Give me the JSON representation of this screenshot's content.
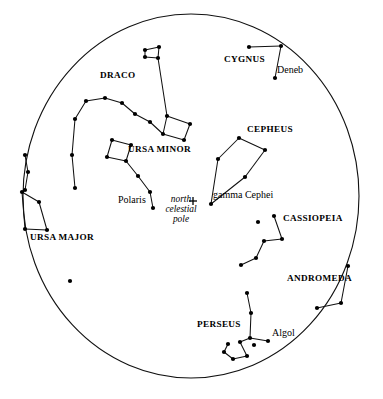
{
  "chart": {
    "type": "star-chart",
    "background_color": "#ffffff",
    "ink_color": "#111111",
    "horizon": {
      "center_x": 191,
      "center_y": 196,
      "radius_x": 168,
      "radius_y": 182
    },
    "pole_marker": {
      "symbol": "+",
      "x": 193,
      "y": 201
    }
  },
  "labels": {
    "constellations": [
      {
        "text": "DRACO",
        "x": 100,
        "y": 76
      },
      {
        "text": "CYGNUS",
        "x": 224,
        "y": 60
      },
      {
        "text": "CEPHEUS",
        "x": 247,
        "y": 130
      },
      {
        "text": "URSA MINOR",
        "x": 128,
        "y": 150
      },
      {
        "text": "CASSIOPEIA",
        "x": 283,
        "y": 219
      },
      {
        "text": "URSA MAJOR",
        "x": 30,
        "y": 238
      },
      {
        "text": "ANDROMEDA",
        "x": 287,
        "y": 279
      },
      {
        "text": "PERSEUS",
        "x": 197,
        "y": 325
      }
    ],
    "stars": [
      {
        "text": "Deneb",
        "x": 276,
        "y": 71
      },
      {
        "text": "Polaris",
        "x": 119,
        "y": 201
      },
      {
        "text": "gamma Cephei",
        "x": 212,
        "y": 196
      },
      {
        "text": "Algol",
        "x": 272,
        "y": 334
      }
    ],
    "pole": {
      "line1": "north",
      "line2": "celestial",
      "line3": "pole",
      "x": 160,
      "y": 196
    }
  },
  "chart_data": {
    "type": "scatter",
    "projection": "polar / circumpolar",
    "grid": false,
    "legend": false,
    "constellations": [
      {
        "name": "DRACO",
        "stars": [
          [
            159,
            47
          ],
          [
            145,
            50
          ],
          [
            145,
            57
          ],
          [
            158,
            58
          ],
          [
            167,
            116
          ],
          [
            190,
            124
          ],
          [
            184,
            140
          ],
          [
            163,
            134
          ],
          [
            150,
            122
          ],
          [
            135,
            114
          ],
          [
            122,
            103
          ],
          [
            105,
            98
          ],
          [
            86,
            101
          ],
          [
            75,
            119
          ],
          [
            72,
            155
          ],
          [
            75,
            188
          ]
        ],
        "segments": [
          [
            [
              159,
              47
            ],
            [
              145,
              50
            ]
          ],
          [
            [
              145,
              50
            ],
            [
              145,
              57
            ]
          ],
          [
            [
              145,
              57
            ],
            [
              158,
              58
            ]
          ],
          [
            [
              158,
              58
            ],
            [
              159,
              47
            ]
          ],
          [
            [
              158,
              58
            ],
            [
              167,
              116
            ]
          ],
          [
            [
              167,
              116
            ],
            [
              190,
              124
            ]
          ],
          [
            [
              190,
              124
            ],
            [
              184,
              140
            ]
          ],
          [
            [
              184,
              140
            ],
            [
              163,
              134
            ]
          ],
          [
            [
              163,
              134
            ],
            [
              167,
              116
            ]
          ],
          [
            [
              163,
              134
            ],
            [
              150,
              122
            ]
          ],
          [
            [
              150,
              122
            ],
            [
              135,
              114
            ]
          ],
          [
            [
              135,
              114
            ],
            [
              122,
              103
            ]
          ],
          [
            [
              122,
              103
            ],
            [
              105,
              98
            ]
          ],
          [
            [
              105,
              98
            ],
            [
              86,
              101
            ]
          ],
          [
            [
              86,
              101
            ],
            [
              75,
              119
            ]
          ],
          [
            [
              75,
              119
            ],
            [
              72,
              155
            ]
          ],
          [
            [
              72,
              155
            ],
            [
              75,
              188
            ]
          ]
        ]
      },
      {
        "name": "URSA MINOR",
        "stars": [
          [
            112,
            140
          ],
          [
            131,
            145
          ],
          [
            126,
            161
          ],
          [
            107,
            157
          ],
          [
            138,
            176
          ],
          [
            150,
            192
          ],
          [
            153,
            208
          ]
        ],
        "segments": [
          [
            [
              112,
              140
            ],
            [
              131,
              145
            ]
          ],
          [
            [
              131,
              145
            ],
            [
              126,
              161
            ]
          ],
          [
            [
              126,
              161
            ],
            [
              107,
              157
            ]
          ],
          [
            [
              107,
              157
            ],
            [
              112,
              140
            ]
          ],
          [
            [
              126,
              161
            ],
            [
              138,
              176
            ]
          ],
          [
            [
              138,
              176
            ],
            [
              150,
              192
            ]
          ],
          [
            [
              150,
              192
            ],
            [
              153,
              208
            ]
          ]
        ]
      },
      {
        "name": "URSA MAJOR",
        "stars": [
          [
            25,
            155
          ],
          [
            28,
            172
          ],
          [
            25,
            190
          ],
          [
            22,
            192
          ],
          [
            25,
            229
          ],
          [
            47,
            230
          ],
          [
            39,
            202
          ]
        ],
        "segments": [
          [
            [
              25,
              155
            ],
            [
              28,
              172
            ]
          ],
          [
            [
              28,
              172
            ],
            [
              25,
              190
            ]
          ],
          [
            [
              25,
              190
            ],
            [
              22,
              192
            ]
          ],
          [
            [
              22,
              192
            ],
            [
              25,
              229
            ]
          ],
          [
            [
              25,
              229
            ],
            [
              47,
              230
            ]
          ],
          [
            [
              47,
              230
            ],
            [
              39,
              202
            ]
          ],
          [
            [
              39,
              202
            ],
            [
              22,
              192
            ]
          ]
        ]
      },
      {
        "name": "CYGNUS",
        "stars": [
          [
            249,
            47
          ],
          [
            281,
            46
          ],
          [
            275,
            78
          ]
        ],
        "segments": [
          [
            [
              249,
              47
            ],
            [
              281,
              46
            ]
          ],
          [
            [
              281,
              46
            ],
            [
              275,
              78
            ]
          ]
        ]
      },
      {
        "name": "CEPHEUS",
        "stars": [
          [
            239,
            138
          ],
          [
            265,
            150
          ],
          [
            245,
            177
          ],
          [
            211,
            204
          ],
          [
            218,
            159
          ]
        ],
        "segments": [
          [
            [
              239,
              138
            ],
            [
              265,
              150
            ]
          ],
          [
            [
              265,
              150
            ],
            [
              245,
              177
            ]
          ],
          [
            [
              245,
              177
            ],
            [
              211,
              204
            ]
          ],
          [
            [
              211,
              204
            ],
            [
              218,
              159
            ]
          ],
          [
            [
              218,
              159
            ],
            [
              239,
              138
            ]
          ]
        ]
      },
      {
        "name": "CASSIOPEIA",
        "stars": [
          [
            274,
            216
          ],
          [
            282,
            239
          ],
          [
            264,
            241
          ],
          [
            256,
            258
          ],
          [
            241,
            265
          ],
          [
            258,
            222
          ]
        ],
        "segments": [
          [
            [
              274,
              216
            ],
            [
              282,
              239
            ]
          ],
          [
            [
              282,
              239
            ],
            [
              264,
              241
            ]
          ],
          [
            [
              264,
              241
            ],
            [
              256,
              258
            ]
          ],
          [
            [
              256,
              258
            ],
            [
              241,
              265
            ]
          ]
        ]
      },
      {
        "name": "ANDROMEDA",
        "stars": [
          [
            348,
            266
          ],
          [
            341,
            303
          ],
          [
            317,
            308
          ]
        ],
        "segments": [
          [
            [
              348,
              266
            ],
            [
              341,
              303
            ]
          ],
          [
            [
              341,
              303
            ],
            [
              317,
              308
            ]
          ]
        ]
      },
      {
        "name": "PERSEUS",
        "stars": [
          [
            247,
            293
          ],
          [
            251,
            313
          ],
          [
            250,
            338
          ],
          [
            268,
            341
          ],
          [
            240,
            342
          ],
          [
            247,
            356
          ],
          [
            233,
            359
          ],
          [
            224,
            352
          ],
          [
            228,
            344
          ],
          [
            254,
            345
          ]
        ],
        "segments": [
          [
            [
              247,
              293
            ],
            [
              251,
              313
            ]
          ],
          [
            [
              251,
              313
            ],
            [
              250,
              338
            ]
          ],
          [
            [
              250,
              338
            ],
            [
              268,
              341
            ]
          ],
          [
            [
              250,
              338
            ],
            [
              240,
              342
            ]
          ],
          [
            [
              240,
              342
            ],
            [
              247,
              356
            ]
          ],
          [
            [
              247,
              356
            ],
            [
              233,
              359
            ]
          ],
          [
            [
              233,
              359
            ],
            [
              224,
              352
            ]
          ],
          [
            [
              224,
              352
            ],
            [
              228,
              344
            ]
          ]
        ]
      }
    ],
    "unconnected_stars": [
      [
        70,
        281
      ]
    ]
  }
}
